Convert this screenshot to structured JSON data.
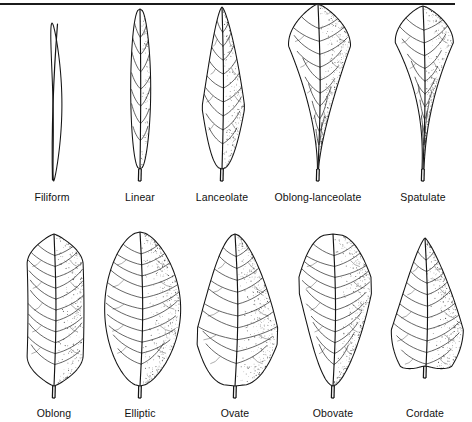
{
  "figure": {
    "background_color": "#ffffff",
    "ink_color": "#141414",
    "rule": {
      "name": "top-rule",
      "color": "#1b1b1b",
      "width": 455,
      "height": 2
    },
    "rows": [
      {
        "name": "row-top",
        "leaves": [
          {
            "label": "Filiform",
            "shape": "filiform",
            "center_x": 52,
            "blade_width": 10,
            "blade_height": 158,
            "vein_pairs": 0,
            "widest_at": 0.5,
            "tip": "acuminate",
            "base": "attenuate"
          },
          {
            "label": "Linear",
            "shape": "linear",
            "center_x": 140,
            "blade_width": 20,
            "blade_height": 160,
            "vein_pairs": 7,
            "widest_at": 0.48,
            "tip": "acute",
            "base": "attenuate"
          },
          {
            "label": "Lanceolate",
            "shape": "lanceolate",
            "center_x": 222,
            "blade_width": 42,
            "blade_height": 162,
            "vein_pairs": 9,
            "widest_at": 0.62,
            "tip": "acuminate",
            "base": "acute"
          },
          {
            "label": "Oblong-lanceolate",
            "shape": "oblong-lanceolate",
            "center_x": 318,
            "blade_width": 62,
            "blade_height": 165,
            "vein_pairs": 10,
            "widest_at": 0.25,
            "tip": "rounded",
            "base": "attenuate"
          },
          {
            "label": "Spatulate",
            "shape": "spatulate",
            "center_x": 423,
            "blade_width": 58,
            "blade_height": 163,
            "vein_pairs": 10,
            "widest_at": 0.22,
            "tip": "rounded",
            "base": "long-attenuate"
          }
        ]
      },
      {
        "name": "row-bottom",
        "leaves": [
          {
            "label": "Oblong",
            "shape": "oblong",
            "center_x": 54,
            "blade_width": 56,
            "blade_height": 152,
            "vein_pairs": 11,
            "widest_at": 0.5,
            "tip": "rounded",
            "base": "rounded"
          },
          {
            "label": "Elliptic",
            "shape": "elliptic",
            "center_x": 140,
            "blade_width": 76,
            "blade_height": 154,
            "vein_pairs": 11,
            "widest_at": 0.5,
            "tip": "acute",
            "base": "acute"
          },
          {
            "label": "Ovate",
            "shape": "ovate",
            "center_x": 235,
            "blade_width": 80,
            "blade_height": 152,
            "vein_pairs": 10,
            "widest_at": 0.68,
            "tip": "acuminate",
            "base": "rounded"
          },
          {
            "label": "Obovate",
            "shape": "obovate",
            "center_x": 333,
            "blade_width": 72,
            "blade_height": 152,
            "vein_pairs": 11,
            "widest_at": 0.33,
            "tip": "rounded",
            "base": "acute"
          },
          {
            "label": "Cordate",
            "shape": "cordate",
            "center_x": 425,
            "blade_width": 72,
            "blade_height": 148,
            "vein_pairs": 10,
            "widest_at": 0.62,
            "tip": "acuminate",
            "base": "cordate"
          }
        ]
      }
    ]
  }
}
